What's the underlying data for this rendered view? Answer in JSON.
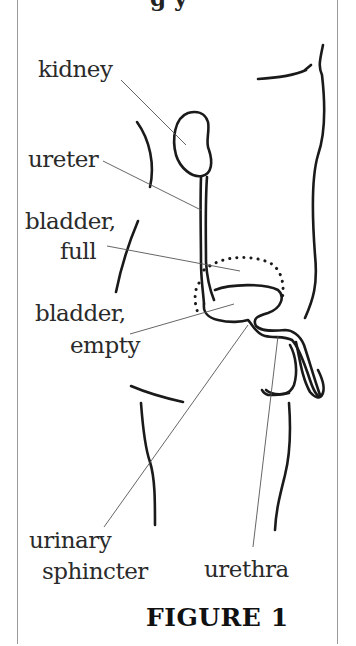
{
  "figure": {
    "title": "FIGURE 1",
    "top_fragment": "g y"
  },
  "labels": {
    "kidney": "kidney",
    "ureter": "ureter",
    "bladder_full_line1": "bladder,",
    "bladder_full_line2": "full",
    "bladder_empty_line1": "bladder,",
    "bladder_empty_line2": "empty",
    "urinary_sphincter_line1": "urinary",
    "urinary_sphincter_line2": "sphincter",
    "urethra": "urethra"
  },
  "colors": {
    "ink": "#1a1a1a",
    "leader_line": "#555555",
    "border": "#9a9a9a",
    "background": "#ffffff"
  }
}
